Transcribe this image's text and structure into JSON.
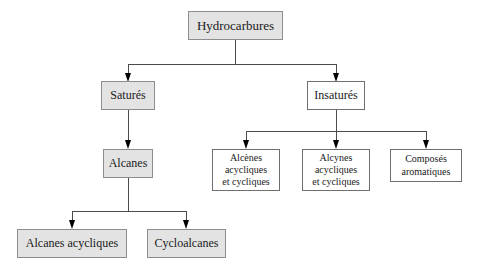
{
  "diagram": {
    "title_text": "Hydrocarbures",
    "nodes": {
      "root": {
        "label": "Hydrocarbures"
      },
      "satures": {
        "label": "Saturés"
      },
      "insatures": {
        "label": "Insaturés"
      },
      "alcanes": {
        "label": "Alcanes"
      },
      "alcenes": {
        "label": "Alcènes\nacycliques\net cycliques"
      },
      "alcynes": {
        "label": "Alcynes\nacycliques\net cycliques"
      },
      "aromatiques": {
        "label": "Composés\naromatiques"
      },
      "alcanes_acycliques": {
        "label": "Alcanes acycliques"
      },
      "cycloalcanes": {
        "label": "Cycloalcanes"
      }
    },
    "colors": {
      "box_fill_gray": "#e3e3e3",
      "box_fill_white": "#ffffff",
      "box_border": "#8d8d8d",
      "connector": "#4a4a4a",
      "arrowhead": "#000000",
      "text": "#1a1a1a",
      "background": "#ffffff"
    }
  }
}
